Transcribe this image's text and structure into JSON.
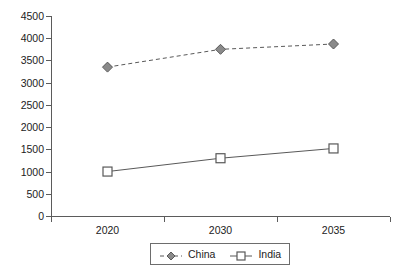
{
  "chart_data": {
    "type": "line",
    "title": "",
    "subtitle": "",
    "xlabel": "",
    "ylabel": "",
    "categories": [
      "2020",
      "2030",
      "2035"
    ],
    "series": [
      {
        "name": "China",
        "values": [
          3350,
          3750,
          3870
        ],
        "marker": "diamond",
        "line_style": "dashed",
        "color": "#595959"
      },
      {
        "name": "India",
        "values": [
          1000,
          1300,
          1520
        ],
        "marker": "square",
        "line_style": "solid",
        "color": "#595959"
      }
    ],
    "ylim": [
      0,
      4500
    ],
    "y_ticks": [
      "0",
      "500",
      "1000",
      "1500",
      "2000",
      "2500",
      "3000",
      "3500",
      "4000",
      "4500"
    ],
    "grid": false,
    "legend_position": "bottom"
  },
  "legend": {
    "entries": [
      {
        "label": "China",
        "marker": "diamond-marker-icon"
      },
      {
        "label": "India",
        "marker": "square-marker-icon"
      }
    ]
  }
}
